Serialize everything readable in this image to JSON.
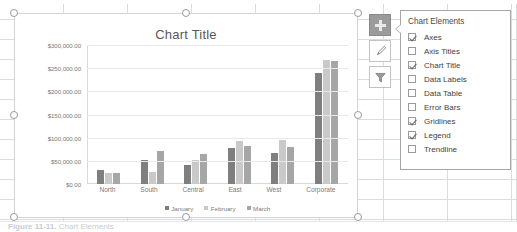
{
  "chart_data": {
    "type": "bar",
    "title": "Chart Title",
    "xlabel": "",
    "ylabel": "",
    "ylim": [
      0,
      300000
    ],
    "ytick_labels": [
      "$300,000.00",
      "$250,000.00",
      "$200,000.00",
      "$150,000.00",
      "$100,000.00",
      "$50,000.00",
      "$0.00"
    ],
    "ytick_values": [
      300000,
      250000,
      200000,
      150000,
      100000,
      50000,
      0
    ],
    "grid": true,
    "legend_position": "bottom",
    "categories": [
      "North",
      "South",
      "Central",
      "East",
      "West",
      "Corporate"
    ],
    "series": [
      {
        "name": "January",
        "color": "#7f7f7f",
        "values": [
          30000,
          52000,
          42000,
          78000,
          68000,
          240000
        ]
      },
      {
        "name": "February",
        "color": "#c9c9c9",
        "values": [
          24000,
          26000,
          52000,
          92000,
          94000,
          268000
        ]
      },
      {
        "name": "March",
        "color": "#a6a6a6",
        "values": [
          23000,
          72000,
          65000,
          82000,
          80000,
          265000
        ]
      }
    ]
  },
  "chart_object": {
    "title": "Chart Title",
    "selected": true
  },
  "side_buttons": [
    {
      "name": "chart-elements",
      "icon": "plus-icon",
      "label": "+",
      "active": true
    },
    {
      "name": "chart-styles",
      "icon": "paintbrush-icon",
      "label": "",
      "active": false
    },
    {
      "name": "chart-filters",
      "icon": "funnel-icon",
      "label": "",
      "active": false
    }
  ],
  "flyout": {
    "title": "Chart Elements",
    "items": [
      {
        "label": "Axes",
        "checked": true
      },
      {
        "label": "Axis Titles",
        "checked": false
      },
      {
        "label": "Chart Title",
        "checked": true
      },
      {
        "label": "Data Labels",
        "checked": false
      },
      {
        "label": "Data Table",
        "checked": false
      },
      {
        "label": "Error Bars",
        "checked": false
      },
      {
        "label": "Gridlines",
        "checked": true
      },
      {
        "label": "Legend",
        "checked": true
      },
      {
        "label": "Trendline",
        "checked": false
      }
    ]
  },
  "caption": {
    "number": "Figure 11-11.",
    "text": "Chart Elements"
  }
}
